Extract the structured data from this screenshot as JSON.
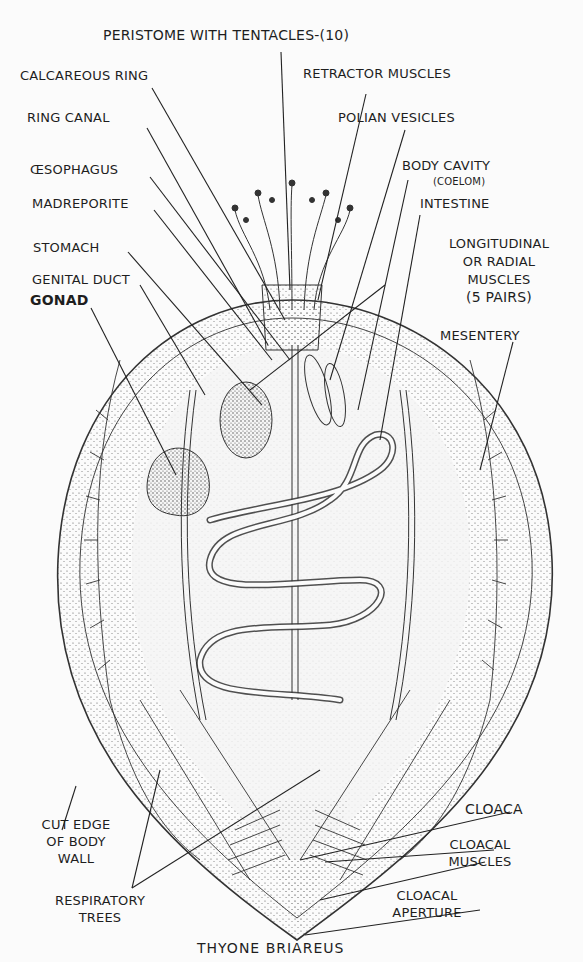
{
  "diagram": {
    "title": "THYONE BRIAREUS",
    "labels": {
      "peristome": "PERISTOME WITH TENTACLES-(10)",
      "calcareous_ring": "CALCAREOUS RING",
      "retractor_muscles": "RETRACTOR MUSCLES",
      "ring_canal": "RING CANAL",
      "polian_vesicles": "POLIAN VESICLES",
      "oesophagus": "ŒSOPHAGUS",
      "body_cavity": "BODY CAVITY",
      "coelom": "(COELOM)",
      "madreporite": "MADREPORITE",
      "intestine": "INTESTINE",
      "stomach": "STOMACH",
      "genital_duct": "GENITAL DUCT",
      "longitudinal_1": "LONGITUDINAL",
      "longitudinal_2": "OR RADIAL",
      "longitudinal_3": "MUSCLES",
      "longitudinal_4": "(5 PAIRS)",
      "gonad": "GONAD",
      "mesentery": "MESENTERY",
      "cut_edge_1": "CUT EDGE",
      "cut_edge_2": "OF BODY",
      "cut_edge_3": "WALL",
      "cloaca": "CLOACA",
      "cloacal_muscles_1": "CLOACAL",
      "cloacal_muscles_2": "MUSCLES",
      "respiratory_1": "RESPIRATORY",
      "respiratory_2": "TREES",
      "cloacal_aperture_1": "CLOACAL",
      "cloacal_aperture_2": "APERTURE"
    }
  }
}
